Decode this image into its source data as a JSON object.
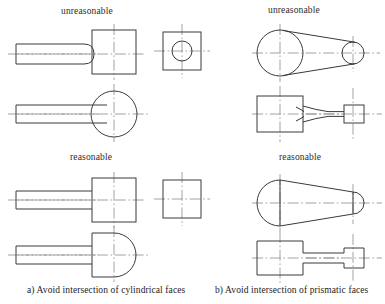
{
  "figure": {
    "title_a": "a) Avoid intersection of cylindrical faces",
    "title_b": "b) Avoid intersection of prismatic faces",
    "labels": {
      "unreasonable_left": "unreasonable",
      "unreasonable_right": "unreasonable",
      "reasonable_left": "reasonable",
      "reasonable_right": "reasonable"
    },
    "colors": {
      "background": "#ffffff",
      "outline": "#3a3a3a",
      "centerline": "#8a8a8a",
      "text": "#1c1c1c"
    },
    "panels": [
      {
        "id": "a",
        "caption": "a) Avoid intersection of cylindrical faces",
        "groups": [
          {
            "state": "unreasonable",
            "views": [
              {
                "name": "front-view-shaft-square-block-filleted",
                "description": "shaft with curved fillet blending into square block"
              },
              {
                "name": "end-view-square-with-circle",
                "description": "square outline with inscribed circle"
              },
              {
                "name": "front-view-shaft-full-circle",
                "description": "shaft tangent to full circle"
              }
            ]
          },
          {
            "state": "reasonable",
            "views": [
              {
                "name": "front-view-shaft-square-shoulder",
                "description": "shaft with square shoulder into block"
              },
              {
                "name": "end-view-square",
                "description": "plain square outline"
              },
              {
                "name": "front-view-shaft-domed-block",
                "description": "shaft into block with semicircular dome end"
              }
            ]
          }
        ]
      },
      {
        "id": "b",
        "caption": "b) Avoid intersection of prismatic faces",
        "groups": [
          {
            "state": "unreasonable",
            "views": [
              {
                "name": "top-view-two-circles-tangent-taper",
                "description": "large and small circle joined by tangent taper lines"
              },
              {
                "name": "front-view-tapered-web-curved",
                "description": "blocks joined by curved tapering web"
              }
            ]
          },
          {
            "state": "reasonable",
            "views": [
              {
                "name": "top-view-rounded-ends-taper",
                "description": "rounded ends separated by tangent lines from tapered body"
              },
              {
                "name": "front-view-straight-web-square-shoulders",
                "description": "blocks joined by straight web with square shoulders"
              }
            ]
          }
        ]
      }
    ]
  }
}
